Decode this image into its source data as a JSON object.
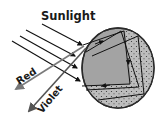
{
  "diagram": {
    "labels": {
      "sunlight": "Sunlight",
      "red": "Red",
      "violet": "Violet"
    },
    "colors": {
      "drop_fill": "#a3a3a3",
      "drop_stroke": "#2a2a2a",
      "incoming_ray": "#111111",
      "red_ray": "#7a7a7a",
      "violet_ray": "#555555",
      "text": "#1a1a1a"
    },
    "elements": [
      {
        "id": "sunlight-rays",
        "count": 4,
        "direction": "upper-left to lower-right"
      },
      {
        "id": "raindrop",
        "shape": "circle"
      },
      {
        "id": "red-exit-ray",
        "direction": "lower-left"
      },
      {
        "id": "violet-exit-ray",
        "direction": "lower-left, steeper"
      }
    ]
  }
}
